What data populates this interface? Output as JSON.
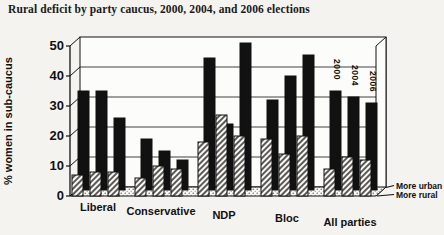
{
  "page": {
    "title": "Rural deficit by party caucus, 2000, 2004, and 2006 elections"
  },
  "chart_data": {
    "type": "bar",
    "projection": "3d-grouped-pairs",
    "title": "Rural deficit by party caucus, 2000, 2004, and 2006 elections",
    "xlabel": "",
    "ylabel": "% women in sub-caucus",
    "ylim": [
      0,
      50
    ],
    "yticks": [
      0,
      10,
      20,
      30,
      40,
      50
    ],
    "grid": true,
    "legend_position": "bottom-right",
    "categories": [
      "Liberal",
      "Conservative",
      "NDP",
      "Bloc",
      "All parties"
    ],
    "group_year_labels": [
      "2000",
      "2004",
      "2006"
    ],
    "group_year_labels_shown_over": "All parties",
    "series": [
      {
        "name": "More urban",
        "row": "back",
        "fill": "solid-black",
        "values": [
          [
            33,
            33,
            24
          ],
          [
            17,
            13,
            10
          ],
          [
            44,
            22,
            49
          ],
          [
            30,
            38,
            45
          ],
          [
            33,
            31,
            29
          ]
        ]
      },
      {
        "name": "More rural",
        "row": "front",
        "fill": "diagonal-hatch",
        "values": [
          [
            7,
            8,
            8
          ],
          [
            6,
            10,
            9
          ],
          [
            18,
            27,
            20
          ],
          [
            19,
            14,
            20
          ],
          [
            9,
            13,
            12
          ]
        ]
      }
    ],
    "colors": {
      "urban_bar": "#111111",
      "hatch_stroke": "#161616",
      "bar_face": "#f9f8f5",
      "outline": "#111111",
      "wall": "#fcfcfa",
      "paper": "#f4f3f0"
    }
  }
}
